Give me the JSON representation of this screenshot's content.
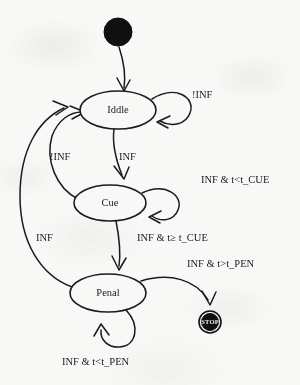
{
  "diagram": {
    "type": "uml-state-machine",
    "background_color": "#f8f8f7",
    "stroke_color": "#1b1b1b",
    "initial_node": {
      "name": "initial-state",
      "shape": "filled-circle",
      "color": "#101010",
      "cx": 118,
      "cy": 32,
      "r": 14
    },
    "final_node": {
      "name": "final-state",
      "label": "STOP",
      "shape": "filled-circle-with-ring",
      "color": "#101010",
      "label_color": "#f2f2f2",
      "cx": 210,
      "cy": 322,
      "r": 11
    },
    "states": [
      {
        "id": "iddle",
        "label": "Iddle",
        "cx": 118,
        "cy": 110,
        "rx": 38,
        "ry": 19
      },
      {
        "id": "cue",
        "label": "Cue",
        "cx": 110,
        "cy": 203,
        "rx": 36,
        "ry": 18
      },
      {
        "id": "penal",
        "label": "Penal",
        "cx": 108,
        "cy": 293,
        "rx": 38,
        "ry": 19
      }
    ],
    "transitions": [
      {
        "id": "start-to-iddle",
        "from": "initial",
        "to": "iddle",
        "label": ""
      },
      {
        "id": "iddle-self",
        "from": "iddle",
        "to": "iddle",
        "label": "!INF",
        "label_x": 192,
        "label_y": 96
      },
      {
        "id": "iddle-to-cue",
        "from": "iddle",
        "to": "cue",
        "label": "INF",
        "label_x": 119,
        "label_y": 158
      },
      {
        "id": "cue-to-iddle",
        "from": "cue",
        "to": "iddle",
        "label": "!INF",
        "label_x": 50,
        "label_y": 158
      },
      {
        "id": "cue-self",
        "from": "cue",
        "to": "cue",
        "label": "INF & t<t_CUE",
        "label_x": 201,
        "label_y": 181
      },
      {
        "id": "cue-to-penal",
        "from": "cue",
        "to": "penal",
        "label": "INF & t≥ t_CUE",
        "label_x": 137,
        "label_y": 239
      },
      {
        "id": "penal-to-iddle",
        "from": "penal",
        "to": "iddle",
        "label": "INF",
        "label_x": 36,
        "label_y": 239
      },
      {
        "id": "penal-self",
        "from": "penal",
        "to": "penal",
        "label": "INF & t<t_PEN",
        "label_x": 62,
        "label_y": 363
      },
      {
        "id": "penal-to-stop",
        "from": "penal",
        "to": "final",
        "label": "INF & t>t_PEN",
        "label_x": 187,
        "label_y": 265
      }
    ]
  }
}
